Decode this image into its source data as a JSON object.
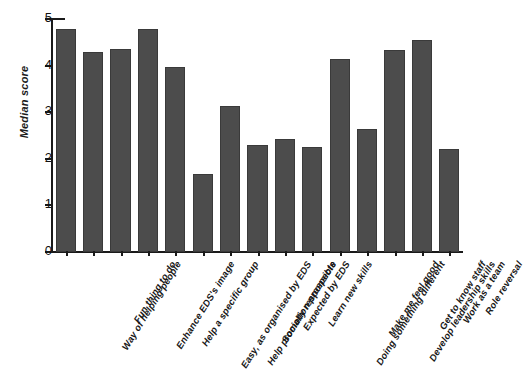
{
  "chart_data": {
    "type": "bar",
    "title": "",
    "xlabel": "",
    "ylabel": "Median score",
    "ylim": [
      0,
      5
    ],
    "yticks": [
      0,
      1,
      2,
      3,
      4,
      5
    ],
    "grid": false,
    "legend": false,
    "orientation": "vertical",
    "bar_color": "#4c4c4c",
    "categories": [
      "Way of helping people",
      "Fun thing to do",
      "Enhance EDS's image",
      "Help a specific group",
      "Easy, as organised by EDS",
      "Help promotion prospects",
      "Socially responsible",
      "Expected by EDS",
      "Learn new skills",
      "Doing something different",
      "Make me feel good",
      "Develop leadership skills",
      "Get to know staff",
      "Work as a team",
      "Role reversal"
    ],
    "values": [
      4.78,
      4.3,
      4.35,
      4.78,
      3.97,
      1.67,
      3.13,
      2.3,
      2.42,
      2.25,
      4.15,
      2.63,
      4.33,
      4.55,
      2.22
    ]
  }
}
